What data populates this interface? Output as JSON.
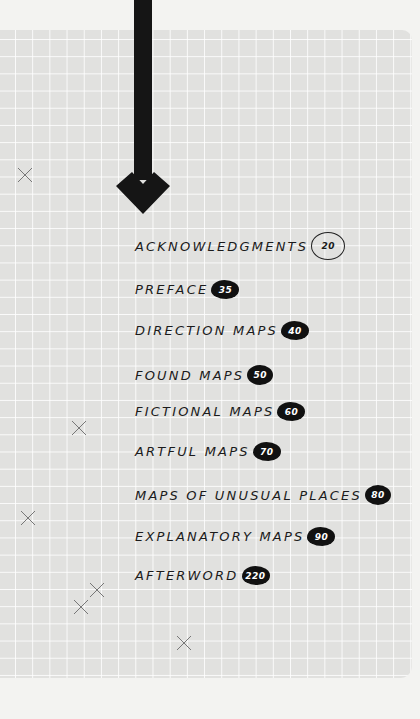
{
  "page": {
    "background_color": "#f3f3f1",
    "sheet_color": "#e1e1df",
    "grid_line_color": "#ffffff",
    "ink_color": "#111111"
  },
  "decorations": {
    "arrow": "down-arrow",
    "x_marks": [
      {
        "x": 25,
        "y": 175
      },
      {
        "x": 79,
        "y": 428
      },
      {
        "x": 28,
        "y": 518
      },
      {
        "x": 96,
        "y": 590
      },
      {
        "x": 80,
        "y": 607
      },
      {
        "x": 184,
        "y": 643
      }
    ]
  },
  "toc": {
    "items": [
      {
        "label": "Acknowledgments",
        "page": "20",
        "style": "outline"
      },
      {
        "label": "Preface",
        "page": "35",
        "style": "filled"
      },
      {
        "label": "Direction Maps",
        "page": "40",
        "style": "filled"
      },
      {
        "label": "Found Maps",
        "page": "50",
        "style": "round"
      },
      {
        "label": "Fictional Maps",
        "page": "60",
        "style": "filled"
      },
      {
        "label": "Artful Maps",
        "page": "70",
        "style": "filled"
      },
      {
        "label": "Maps of Unusual Places",
        "page": "80",
        "style": "round"
      },
      {
        "label": "Explanatory Maps",
        "page": "90",
        "style": "filled"
      },
      {
        "label": "Afterword",
        "page": "220",
        "style": "filled"
      }
    ]
  }
}
